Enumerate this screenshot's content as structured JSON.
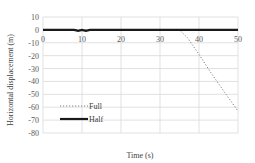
{
  "chart_data": {
    "type": "line",
    "title": "",
    "xlabel": "Time (s)",
    "ylabel": "Horizontal displacement (m)",
    "xlim": [
      0,
      50
    ],
    "ylim": [
      -80,
      10
    ],
    "x_ticks": [
      "0",
      "10",
      "20",
      "30",
      "40",
      "50"
    ],
    "y_ticks": [
      "10",
      "0",
      "-10",
      "-20",
      "-30",
      "-40",
      "-50",
      "-60",
      "-70",
      "-80"
    ],
    "grid": true,
    "legend_position": "inside-lower-left",
    "series": [
      {
        "name": "Full",
        "style": "dotted",
        "color": "#7f7f7f",
        "x": [
          0,
          10,
          20,
          30,
          35,
          37,
          40,
          43,
          46,
          50
        ],
        "y": [
          0,
          0,
          0,
          0,
          0,
          -6,
          -19,
          -33,
          -46,
          -63
        ]
      },
      {
        "name": "Half",
        "style": "solid-thick",
        "color": "#1a1a1a",
        "x": [
          0,
          8,
          9,
          10,
          11,
          12,
          13,
          20,
          30,
          40,
          50
        ],
        "y": [
          0,
          0,
          -0.8,
          0,
          -0.8,
          0,
          0,
          0,
          0,
          0,
          0
        ]
      }
    ]
  }
}
